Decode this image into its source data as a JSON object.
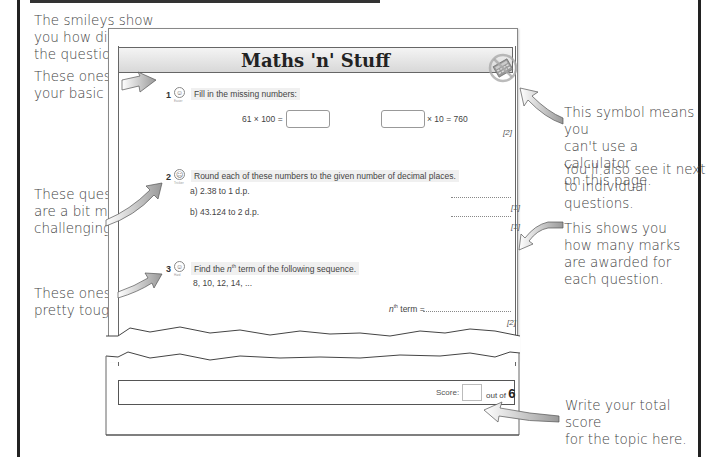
{
  "page": {
    "title": "Maths 'n' Stuff"
  },
  "annotations": {
    "smileys_intro": [
      "The smileys show",
      "you how difficult",
      "the questions are."
    ],
    "easy": [
      "These ones test",
      "your basic skills."
    ],
    "tricky": [
      "These questions",
      "are a bit more",
      "challenging."
    ],
    "hard": [
      "These ones are",
      "pretty tough."
    ],
    "calculator": [
      "This symbol means you",
      "can't use a calculator",
      "on this page."
    ],
    "calculator_extra": [
      "You'll also see it next",
      "to individual questions."
    ],
    "marks": [
      "This shows you",
      "how many marks",
      "are awarded for",
      "each question."
    ],
    "score": [
      "Write your total score",
      "for the topic here."
    ]
  },
  "questions": [
    {
      "number": "1",
      "difficulty": "Easier",
      "smiley_icon": "easy-smiley-icon",
      "prompt": "Fill in the missing numbers:",
      "parts": [
        {
          "text": "61 × 100 =",
          "answer": ""
        },
        {
          "text": "× 10 = 760",
          "answer": ""
        }
      ],
      "marks": "[2]"
    },
    {
      "number": "2",
      "difficulty": "Trickier",
      "smiley_icon": "tricky-smiley-icon",
      "prompt": "Round each of these numbers to the given number of decimal places.",
      "parts": [
        {
          "text": "a) 2.38 to 1 d.p.",
          "marks": "[1]"
        },
        {
          "text": "b) 43.124 to 2 d.p.",
          "marks": "[1]"
        }
      ]
    },
    {
      "number": "3",
      "difficulty": "Hard",
      "smiley_icon": "hard-smiley-icon",
      "prompt_pre": "Find the ",
      "prompt_n": "n",
      "prompt_sup": "th",
      "prompt_post": " term of the following sequence.",
      "sequence": "8,  10,  12,  14,  ...",
      "answer_label_n": "n",
      "answer_label_sup": "th",
      "answer_label_post": " term =",
      "marks": "[2]"
    }
  ],
  "score": {
    "label": "Score:",
    "value": "",
    "out_of_label": "out of",
    "total": "6"
  },
  "icons": {
    "no_calculator": "no-calculator-icon"
  }
}
